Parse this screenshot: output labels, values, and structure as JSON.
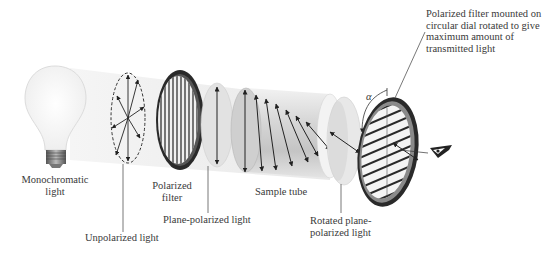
{
  "figure": {
    "labels": {
      "monochromatic_light": [
        "Monochromatic",
        "light"
      ],
      "unpolarized_light": "Unpolarized light",
      "polarized_filter": [
        "Polarized",
        "filter"
      ],
      "plane_polarized_light": "Plane-polarized light",
      "sample_tube": "Sample tube",
      "rotated_plane_polarized_light": [
        "Rotated plane-",
        "polarized light"
      ],
      "analyzer_filter": [
        "Polarized filter mounted on",
        "circular dial rotated to give",
        "maximum amount of",
        "transmitted light"
      ],
      "rotation_angle_symbol": "α"
    },
    "components": [
      {
        "id": "light-bulb",
        "name": "Monochromatic light source"
      },
      {
        "id": "unpolarized-light",
        "name": "Unpolarized light (arrows in all directions)"
      },
      {
        "id": "polarizer",
        "name": "Polarized filter (vertical slits)"
      },
      {
        "id": "plane-polarized-disc",
        "name": "Plane-polarized light"
      },
      {
        "id": "sample-tube",
        "name": "Sample tube"
      },
      {
        "id": "rotated-disc",
        "name": "Rotated plane-polarized light"
      },
      {
        "id": "analyzer",
        "name": "Polarized filter on circular dial (diagonal slits)"
      },
      {
        "id": "eye",
        "name": "Observer eye"
      }
    ],
    "colors": {
      "beam": "#ececec",
      "filter_ring": "#2a2a2a",
      "arrow": "#222222",
      "text": "#3a3a3a"
    }
  }
}
